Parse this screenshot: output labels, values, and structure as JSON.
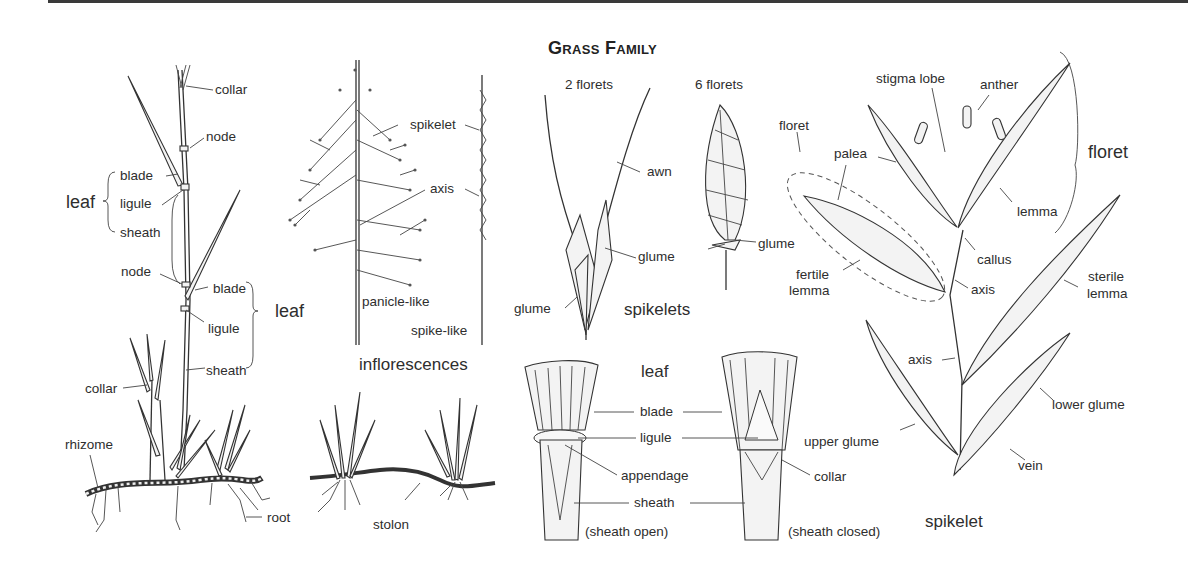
{
  "title": "Grass Family",
  "colors": {
    "ink": "#2e2e2e",
    "rule": "#3a3a3a",
    "background": "#ffffff"
  },
  "plant": {
    "labels": {
      "collar_top": "collar",
      "node_top": "node",
      "blade_1": "blade",
      "ligule_1": "ligule",
      "sheath_1": "sheath",
      "leaf_1": "leaf",
      "node_2": "node",
      "blade_2": "blade",
      "ligule_2": "ligule",
      "sheath_2": "sheath",
      "leaf_2": "leaf",
      "collar_low": "collar",
      "rhizome": "rhizome",
      "root": "root",
      "stolon": "stolon"
    }
  },
  "inflorescences": {
    "spikelet": "spikelet",
    "axis": "axis",
    "panicle": "panicle-like",
    "spike": "spike-like",
    "caption": "inflorescences"
  },
  "spikelets": {
    "two_florets": "2 florets",
    "six_florets": "6 florets",
    "awn": "awn",
    "glume_mid": "glume",
    "glume_low": "glume",
    "glume_right": "glume",
    "caption": "spikelets"
  },
  "leaf_detail": {
    "caption": "leaf",
    "blade": "blade",
    "ligule": "ligule",
    "appendage": "appendage",
    "sheath": "sheath",
    "collar": "collar",
    "open": "(sheath open)",
    "closed": "(sheath closed)"
  },
  "spikelet_detail": {
    "stigma_lobe": "stigma lobe",
    "anther": "anther",
    "floret_left": "floret",
    "palea": "palea",
    "floret_right": "floret",
    "lemma": "lemma",
    "callus": "callus",
    "fertile_lemma": "fertile\nlemma",
    "fertile": "fertile",
    "lemma2": "lemma",
    "axis_top": "axis",
    "sterile": "sterile",
    "sterile_lemma": "lemma",
    "axis_low": "axis",
    "lower_glume": "lower glume",
    "upper_glume": "upper glume",
    "vein": "vein",
    "caption": "spikelet"
  }
}
